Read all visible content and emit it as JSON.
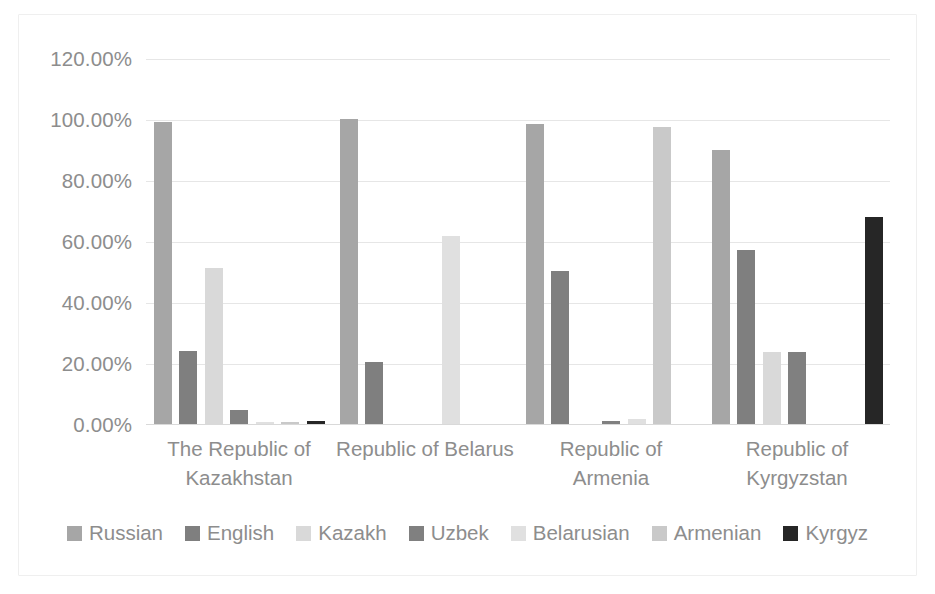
{
  "chart_data": {
    "type": "bar",
    "title": "",
    "subtitle": "",
    "xlabel": "",
    "ylabel": "",
    "ylim": [
      0,
      120
    ],
    "ytick_labels": [
      "120.00%",
      "100.00%",
      "80.00%",
      "60.00%",
      "40.00%",
      "20.00%",
      "0.00%"
    ],
    "ytick_values": [
      120,
      100,
      80,
      60,
      40,
      20,
      0
    ],
    "grid": true,
    "legend_position": "bottom",
    "categories": [
      "The Republic of Kazakhstan",
      "Republic of Belarus",
      "Republic of Armenia",
      "Republic of Kyrgyzstan"
    ],
    "category_lines": [
      [
        "The Republic of",
        "Kazakhstan"
      ],
      [
        "Republic of Belarus"
      ],
      [
        "Republic of",
        "Armenia"
      ],
      [
        "Republic of",
        "Kyrgyzstan"
      ]
    ],
    "series": [
      {
        "name": "Russian",
        "color": "#a6a6a6",
        "values": [
          99.0,
          100.0,
          98.5,
          90.0
        ]
      },
      {
        "name": "English",
        "color": "#7f7f7f",
        "values": [
          24.0,
          20.3,
          50.3,
          57.0
        ]
      },
      {
        "name": "Kazakh",
        "color": "#d9d9d9",
        "values": [
          51.0,
          0.0,
          0.0,
          23.5
        ]
      },
      {
        "name": "Uzbek",
        "color": "#808080",
        "values": [
          4.5,
          0.0,
          1.0,
          23.5
        ]
      },
      {
        "name": "Belarusian",
        "color": "#e0e0e0",
        "values": [
          0.8,
          61.8,
          1.5,
          0.0
        ]
      },
      {
        "name": "Armenian",
        "color": "#c9c9c9",
        "values": [
          0.8,
          0.0,
          97.5,
          0.0
        ]
      },
      {
        "name": "Kyrgyz",
        "color": "#262626",
        "values": [
          1.0,
          0.0,
          0.0,
          67.8
        ]
      }
    ]
  },
  "legend": {
    "items": [
      {
        "label": "Russian",
        "color": "#a6a6a6"
      },
      {
        "label": "English",
        "color": "#7f7f7f"
      },
      {
        "label": "Kazakh",
        "color": "#d9d9d9"
      },
      {
        "label": "Uzbek",
        "color": "#808080"
      },
      {
        "label": "Belarusian",
        "color": "#e0e0e0"
      },
      {
        "label": "Armenian",
        "color": "#c9c9c9"
      },
      {
        "label": "Kyrgyz",
        "color": "#262626"
      }
    ]
  },
  "style": {
    "plot_background": "#ffffff",
    "gridline_color": "#e6e6e6",
    "text_color": "#8d8d8d",
    "border_color": "#efefef"
  }
}
